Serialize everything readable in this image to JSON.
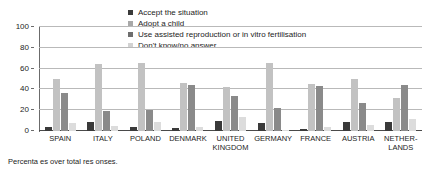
{
  "chart_data": {
    "type": "bar",
    "title": "",
    "xlabel": "",
    "ylabel": "",
    "ylim": [
      0,
      100
    ],
    "yticks": [
      0,
      20,
      40,
      60,
      80,
      100
    ],
    "grid": true,
    "legend_position": "top-center",
    "categories": [
      "SPAIN",
      "ITALY",
      "POLAND",
      "DENMARK",
      "UNITED KINGDOM",
      "GERMANY",
      "FRANCE",
      "AUSTRIA",
      "NETHERLANDS"
    ],
    "category_lines": [
      [
        "SPAIN"
      ],
      [
        "ITALY"
      ],
      [
        "POLAND"
      ],
      [
        "DENMARK"
      ],
      [
        "UNITED",
        "KINGDOM"
      ],
      [
        "GERMANY"
      ],
      [
        "FRANCE"
      ],
      [
        "AUSTRIA"
      ],
      [
        "NETHER-",
        "LANDS"
      ]
    ],
    "series": [
      {
        "name": "Accept the situation",
        "color": "#3a3a3a",
        "values": [
          4,
          9,
          4,
          3,
          10,
          8,
          2,
          9,
          9
        ]
      },
      {
        "name": "Adopt a child",
        "color": "#c2c2c2",
        "values": [
          50,
          64,
          65,
          46,
          42,
          65,
          45,
          50,
          32
        ]
      },
      {
        "name": "Use assisted reproduction or in vitro fertilisation",
        "color": "#8a8a8a",
        "values": [
          37,
          19,
          20,
          44,
          34,
          22,
          43,
          27,
          44
        ]
      },
      {
        "name": "Don't know/no answer",
        "color": "#dcdcdc",
        "values": [
          8,
          5,
          9,
          4,
          13,
          1,
          4,
          6,
          12
        ]
      }
    ],
    "footnote": "Percenta  es over total res  onses."
  },
  "legend": {
    "items": [
      {
        "label": "Accept the situation",
        "color": "#3a3a3a"
      },
      {
        "label": "Adopt a child",
        "color": "#a8a8a8"
      },
      {
        "label": "Use assisted reproduction or in vitro fertilisation",
        "color": "#6e6e6e"
      },
      {
        "label": "Don't know/no answer",
        "color": "#d2d2d2"
      }
    ]
  }
}
